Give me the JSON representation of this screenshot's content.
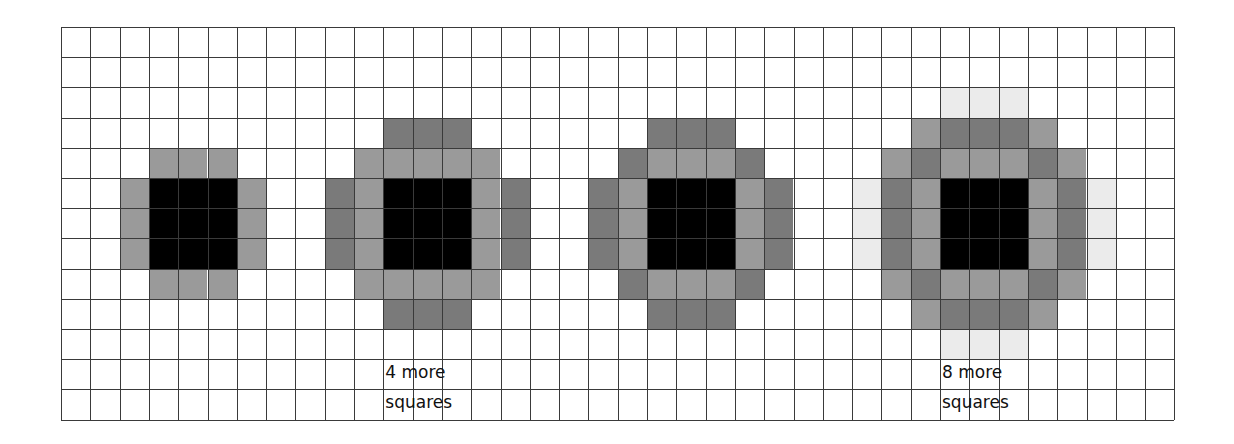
{
  "grid": {
    "columns": 38,
    "rows": 13,
    "origin_x": 61,
    "origin_y": 27,
    "cell_width": 29.3,
    "cell_height": 30.2,
    "line_color": "#3a3a3a"
  },
  "colors": {
    "black": "#000000",
    "medium": "#9a9a9a",
    "dark": "#7a7a7a",
    "light": "#ebebeb"
  },
  "figures": [
    {
      "name": "figure-1",
      "core": {
        "col": 3,
        "row": 5,
        "size": 3
      },
      "cells": [
        {
          "c": 3,
          "r": 4,
          "tone": "medium"
        },
        {
          "c": 4,
          "r": 4,
          "tone": "medium"
        },
        {
          "c": 5,
          "r": 4,
          "tone": "medium"
        },
        {
          "c": 2,
          "r": 5,
          "tone": "medium"
        },
        {
          "c": 2,
          "r": 6,
          "tone": "medium"
        },
        {
          "c": 2,
          "r": 7,
          "tone": "medium"
        },
        {
          "c": 6,
          "r": 5,
          "tone": "medium"
        },
        {
          "c": 6,
          "r": 6,
          "tone": "medium"
        },
        {
          "c": 6,
          "r": 7,
          "tone": "medium"
        },
        {
          "c": 3,
          "r": 8,
          "tone": "medium"
        },
        {
          "c": 4,
          "r": 8,
          "tone": "medium"
        },
        {
          "c": 5,
          "r": 8,
          "tone": "medium"
        }
      ]
    },
    {
      "name": "figure-2",
      "core": {
        "col": 11,
        "row": 5,
        "size": 3
      },
      "cells": [
        {
          "c": 11,
          "r": 3,
          "tone": "dark"
        },
        {
          "c": 12,
          "r": 3,
          "tone": "dark"
        },
        {
          "c": 13,
          "r": 3,
          "tone": "dark"
        },
        {
          "c": 10,
          "r": 4,
          "tone": "medium"
        },
        {
          "c": 11,
          "r": 4,
          "tone": "medium"
        },
        {
          "c": 12,
          "r": 4,
          "tone": "medium"
        },
        {
          "c": 13,
          "r": 4,
          "tone": "medium"
        },
        {
          "c": 14,
          "r": 4,
          "tone": "medium"
        },
        {
          "c": 9,
          "r": 5,
          "tone": "dark"
        },
        {
          "c": 10,
          "r": 5,
          "tone": "medium"
        },
        {
          "c": 14,
          "r": 5,
          "tone": "medium"
        },
        {
          "c": 15,
          "r": 5,
          "tone": "dark"
        },
        {
          "c": 9,
          "r": 6,
          "tone": "dark"
        },
        {
          "c": 10,
          "r": 6,
          "tone": "medium"
        },
        {
          "c": 14,
          "r": 6,
          "tone": "medium"
        },
        {
          "c": 15,
          "r": 6,
          "tone": "dark"
        },
        {
          "c": 9,
          "r": 7,
          "tone": "dark"
        },
        {
          "c": 10,
          "r": 7,
          "tone": "medium"
        },
        {
          "c": 14,
          "r": 7,
          "tone": "medium"
        },
        {
          "c": 15,
          "r": 7,
          "tone": "dark"
        },
        {
          "c": 10,
          "r": 8,
          "tone": "medium"
        },
        {
          "c": 11,
          "r": 8,
          "tone": "medium"
        },
        {
          "c": 12,
          "r": 8,
          "tone": "medium"
        },
        {
          "c": 13,
          "r": 8,
          "tone": "medium"
        },
        {
          "c": 14,
          "r": 8,
          "tone": "medium"
        },
        {
          "c": 11,
          "r": 9,
          "tone": "dark"
        },
        {
          "c": 12,
          "r": 9,
          "tone": "dark"
        },
        {
          "c": 13,
          "r": 9,
          "tone": "dark"
        }
      ],
      "label": {
        "line1": "4 more",
        "line2": "squares",
        "col": 11,
        "row": 11
      }
    },
    {
      "name": "figure-3",
      "core": {
        "col": 20,
        "row": 5,
        "size": 3
      },
      "cells": [
        {
          "c": 20,
          "r": 3,
          "tone": "dark"
        },
        {
          "c": 21,
          "r": 3,
          "tone": "dark"
        },
        {
          "c": 22,
          "r": 3,
          "tone": "dark"
        },
        {
          "c": 19,
          "r": 4,
          "tone": "dark"
        },
        {
          "c": 20,
          "r": 4,
          "tone": "medium"
        },
        {
          "c": 21,
          "r": 4,
          "tone": "medium"
        },
        {
          "c": 22,
          "r": 4,
          "tone": "medium"
        },
        {
          "c": 23,
          "r": 4,
          "tone": "dark"
        },
        {
          "c": 18,
          "r": 5,
          "tone": "dark"
        },
        {
          "c": 19,
          "r": 5,
          "tone": "medium"
        },
        {
          "c": 23,
          "r": 5,
          "tone": "medium"
        },
        {
          "c": 24,
          "r": 5,
          "tone": "dark"
        },
        {
          "c": 18,
          "r": 6,
          "tone": "dark"
        },
        {
          "c": 19,
          "r": 6,
          "tone": "medium"
        },
        {
          "c": 23,
          "r": 6,
          "tone": "medium"
        },
        {
          "c": 24,
          "r": 6,
          "tone": "dark"
        },
        {
          "c": 18,
          "r": 7,
          "tone": "dark"
        },
        {
          "c": 19,
          "r": 7,
          "tone": "medium"
        },
        {
          "c": 23,
          "r": 7,
          "tone": "medium"
        },
        {
          "c": 24,
          "r": 7,
          "tone": "dark"
        },
        {
          "c": 19,
          "r": 8,
          "tone": "dark"
        },
        {
          "c": 20,
          "r": 8,
          "tone": "medium"
        },
        {
          "c": 21,
          "r": 8,
          "tone": "medium"
        },
        {
          "c": 22,
          "r": 8,
          "tone": "medium"
        },
        {
          "c": 23,
          "r": 8,
          "tone": "dark"
        },
        {
          "c": 20,
          "r": 9,
          "tone": "dark"
        },
        {
          "c": 21,
          "r": 9,
          "tone": "dark"
        },
        {
          "c": 22,
          "r": 9,
          "tone": "dark"
        }
      ]
    },
    {
      "name": "figure-4",
      "core": {
        "col": 30,
        "row": 5,
        "size": 3
      },
      "cells": [
        {
          "c": 30,
          "r": 2,
          "tone": "light"
        },
        {
          "c": 31,
          "r": 2,
          "tone": "light"
        },
        {
          "c": 32,
          "r": 2,
          "tone": "light"
        },
        {
          "c": 29,
          "r": 3,
          "tone": "medium"
        },
        {
          "c": 30,
          "r": 3,
          "tone": "dark"
        },
        {
          "c": 31,
          "r": 3,
          "tone": "dark"
        },
        {
          "c": 32,
          "r": 3,
          "tone": "dark"
        },
        {
          "c": 33,
          "r": 3,
          "tone": "medium"
        },
        {
          "c": 28,
          "r": 4,
          "tone": "medium"
        },
        {
          "c": 29,
          "r": 4,
          "tone": "dark"
        },
        {
          "c": 30,
          "r": 4,
          "tone": "medium"
        },
        {
          "c": 31,
          "r": 4,
          "tone": "medium"
        },
        {
          "c": 32,
          "r": 4,
          "tone": "medium"
        },
        {
          "c": 33,
          "r": 4,
          "tone": "dark"
        },
        {
          "c": 34,
          "r": 4,
          "tone": "medium"
        },
        {
          "c": 27,
          "r": 5,
          "tone": "light"
        },
        {
          "c": 28,
          "r": 5,
          "tone": "dark"
        },
        {
          "c": 29,
          "r": 5,
          "tone": "medium"
        },
        {
          "c": 33,
          "r": 5,
          "tone": "medium"
        },
        {
          "c": 34,
          "r": 5,
          "tone": "dark"
        },
        {
          "c": 35,
          "r": 5,
          "tone": "light"
        },
        {
          "c": 27,
          "r": 6,
          "tone": "light"
        },
        {
          "c": 28,
          "r": 6,
          "tone": "dark"
        },
        {
          "c": 29,
          "r": 6,
          "tone": "medium"
        },
        {
          "c": 33,
          "r": 6,
          "tone": "medium"
        },
        {
          "c": 34,
          "r": 6,
          "tone": "dark"
        },
        {
          "c": 35,
          "r": 6,
          "tone": "light"
        },
        {
          "c": 27,
          "r": 7,
          "tone": "light"
        },
        {
          "c": 28,
          "r": 7,
          "tone": "dark"
        },
        {
          "c": 29,
          "r": 7,
          "tone": "medium"
        },
        {
          "c": 33,
          "r": 7,
          "tone": "medium"
        },
        {
          "c": 34,
          "r": 7,
          "tone": "dark"
        },
        {
          "c": 35,
          "r": 7,
          "tone": "light"
        },
        {
          "c": 28,
          "r": 8,
          "tone": "medium"
        },
        {
          "c": 29,
          "r": 8,
          "tone": "dark"
        },
        {
          "c": 30,
          "r": 8,
          "tone": "medium"
        },
        {
          "c": 31,
          "r": 8,
          "tone": "medium"
        },
        {
          "c": 32,
          "r": 8,
          "tone": "medium"
        },
        {
          "c": 33,
          "r": 8,
          "tone": "dark"
        },
        {
          "c": 34,
          "r": 8,
          "tone": "medium"
        },
        {
          "c": 29,
          "r": 9,
          "tone": "medium"
        },
        {
          "c": 30,
          "r": 9,
          "tone": "dark"
        },
        {
          "c": 31,
          "r": 9,
          "tone": "dark"
        },
        {
          "c": 32,
          "r": 9,
          "tone": "dark"
        },
        {
          "c": 33,
          "r": 9,
          "tone": "medium"
        },
        {
          "c": 30,
          "r": 10,
          "tone": "light"
        },
        {
          "c": 31,
          "r": 10,
          "tone": "light"
        },
        {
          "c": 32,
          "r": 10,
          "tone": "light"
        }
      ],
      "label": {
        "line1": "8 more",
        "line2": "squares",
        "col": 30,
        "row": 11
      }
    }
  ],
  "labels": {
    "figure_2_line1": "4 more",
    "figure_2_line2": "squares",
    "figure_4_line1": "8 more",
    "figure_4_line2": "squares"
  }
}
